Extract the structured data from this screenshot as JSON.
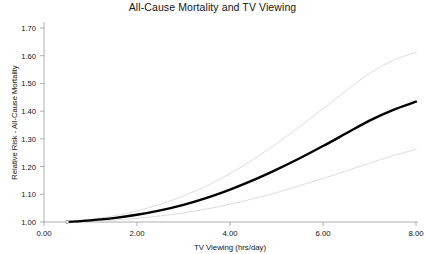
{
  "chart_data": {
    "type": "line",
    "title": "All-Cause Mortality and TV Viewing",
    "xlabel": "TV Viewing (hrs/day)",
    "ylabel": "Relative Risk - All-Cause Mortality",
    "xlim": [
      0.0,
      8.0
    ],
    "ylim": [
      1.0,
      1.7
    ],
    "xticks": [
      0.0,
      2.0,
      4.0,
      6.0,
      8.0
    ],
    "xtick_labels": [
      "0.00",
      "2.00",
      "4.00",
      "6.00",
      "8.00"
    ],
    "yticks": [
      1.0,
      1.1,
      1.2,
      1.3,
      1.4,
      1.5,
      1.6,
      1.7
    ],
    "ytick_labels": [
      "1.00",
      "1.10",
      "1.20",
      "1.30",
      "1.40",
      "1.50",
      "1.60",
      "1.70"
    ],
    "grid": false,
    "legend": "none",
    "reference_point": {
      "x": 0.5,
      "y": 1.0
    },
    "x": [
      0.5,
      1.0,
      1.5,
      2.0,
      2.5,
      3.0,
      3.5,
      4.0,
      4.5,
      5.0,
      5.5,
      6.0,
      6.5,
      7.0,
      7.5,
      8.0
    ],
    "series": [
      {
        "name": "Relative risk (fitted)",
        "color": "#000000",
        "width": 2.4,
        "values": [
          1.0,
          1.006,
          1.014,
          1.026,
          1.042,
          1.062,
          1.087,
          1.117,
          1.151,
          1.189,
          1.23,
          1.274,
          1.32,
          1.366,
          1.404,
          1.434
        ]
      },
      {
        "name": "Upper 95% confidence limit",
        "color": "#d8d8d8",
        "width": 0.9,
        "values": [
          1.002,
          1.01,
          1.022,
          1.04,
          1.064,
          1.094,
          1.131,
          1.175,
          1.226,
          1.283,
          1.344,
          1.409,
          1.474,
          1.536,
          1.583,
          1.612
        ]
      },
      {
        "name": "Lower 95% confidence limit",
        "color": "#d8d8d8",
        "width": 0.9,
        "values": [
          0.998,
          1.002,
          1.007,
          1.013,
          1.022,
          1.033,
          1.047,
          1.064,
          1.084,
          1.106,
          1.131,
          1.157,
          1.184,
          1.212,
          1.239,
          1.262
        ]
      }
    ]
  },
  "axes": {
    "axis_color": "#9a9a9a",
    "tick_color": "#9a9a9a",
    "background": "#ffffff"
  }
}
